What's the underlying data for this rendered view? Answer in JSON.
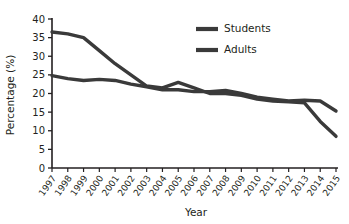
{
  "chart_data": {
    "type": "line",
    "title": "",
    "xlabel": "Year",
    "ylabel": "Percentage (%)",
    "xlim": [
      1997,
      2015
    ],
    "ylim": [
      0,
      40
    ],
    "ytick_step": 5,
    "yticks": [
      0,
      5,
      10,
      15,
      20,
      25,
      30,
      35,
      40
    ],
    "grid": false,
    "legend_position": "top-right",
    "line_color": "#3a3a3a",
    "axis_color": "#231f20",
    "categories": [
      1997,
      1998,
      1999,
      2000,
      2001,
      2002,
      2003,
      2004,
      2005,
      2006,
      2007,
      2008,
      2009,
      2010,
      2011,
      2012,
      2013,
      2014,
      2015
    ],
    "xtick_labels": [
      "1997",
      "1998",
      "1999",
      "2000",
      "2001",
      "2002",
      "2003",
      "2004",
      "2005",
      "2006",
      "2007",
      "2008",
      "2009",
      "2010",
      "2011",
      "2012",
      "2013",
      "2014",
      "2015"
    ],
    "series": [
      {
        "name": "Students",
        "color": "#3a3a3a",
        "values": [
          36.5,
          36.0,
          35.0,
          31.5,
          28.0,
          25.0,
          22.0,
          21.5,
          23.0,
          21.5,
          20.0,
          20.0,
          19.5,
          18.5,
          18.0,
          17.8,
          17.5,
          12.5,
          8.5
        ]
      },
      {
        "name": "Adults",
        "color": "#3a3a3a",
        "values": [
          24.8,
          24.0,
          23.5,
          23.8,
          23.5,
          22.5,
          21.8,
          21.0,
          21.0,
          20.5,
          20.5,
          20.8,
          20.0,
          19.0,
          18.5,
          18.0,
          18.2,
          18.0,
          15.3
        ]
      }
    ],
    "legend": [
      {
        "label": "Students",
        "color": "#3a3a3a"
      },
      {
        "label": "Adults",
        "color": "#3a3a3a"
      }
    ]
  }
}
